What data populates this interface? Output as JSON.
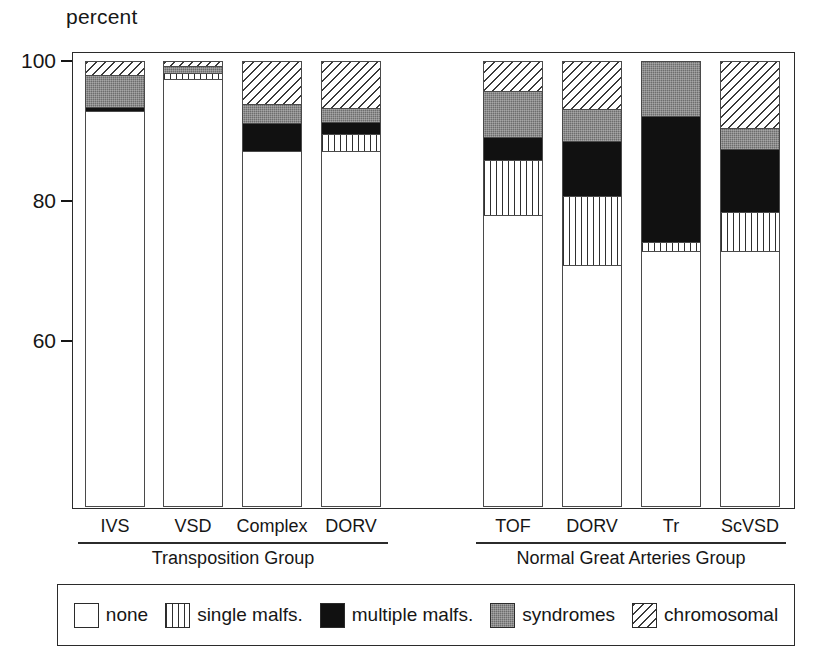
{
  "axis_title": "percent",
  "yticks": [
    {
      "label": "100",
      "value": 100
    },
    {
      "label": "80",
      "value": 80
    },
    {
      "label": "60",
      "value": 60
    }
  ],
  "groups": [
    {
      "name": "Transposition  Group",
      "categories": [
        "IVS",
        "VSD",
        "Complex",
        "DORV"
      ]
    },
    {
      "name": "Normal Great Arteries Group",
      "categories": [
        "TOF",
        "DORV",
        "Tr",
        "ScVSD"
      ]
    }
  ],
  "legend": [
    {
      "key": "none",
      "label": "none"
    },
    {
      "key": "single",
      "label": "single malfs."
    },
    {
      "key": "multiple",
      "label": "multiple malfs."
    },
    {
      "key": "syndromes",
      "label": "syndromes"
    },
    {
      "key": "chromosomal",
      "label": "chromosomal"
    }
  ],
  "colors": {
    "none": "#ffffff",
    "single": "#ffffff",
    "multiple": "#111111",
    "syndromes": "#6d6d6d",
    "chromosomal": "#ffffff",
    "axis": "#2b2b2b",
    "text": "#161616"
  },
  "chart_data": {
    "type": "bar",
    "subtype": "stacked-bar-100",
    "title": "",
    "xlabel": "",
    "ylabel": "percent",
    "ylim": [
      55,
      100
    ],
    "grid": false,
    "legend_position": "bottom",
    "categories": [
      "IVS",
      "VSD",
      "Complex",
      "DORV",
      "TOF",
      "DORV",
      "Tr",
      "ScVSD"
    ],
    "category_groups": [
      "Transposition  Group",
      "Transposition  Group",
      "Transposition  Group",
      "Transposition  Group",
      "Normal Great Arteries Group",
      "Normal Great Arteries Group",
      "Normal Great Arteries Group",
      "Normal Great Arteries Group"
    ],
    "series": [
      {
        "name": "none",
        "values": [
          89.0,
          96.4,
          80.0,
          80.1,
          65.7,
          54.4,
          57.6,
          57.6
        ]
      },
      {
        "name": "single malfs.",
        "values": [
          0.0,
          1.3,
          0.0,
          3.9,
          12.4,
          15.4,
          1.8,
          8.7
        ]
      },
      {
        "name": "multiple malfs.",
        "values": [
          0.9,
          0.0,
          6.4,
          2.6,
          5.0,
          12.4,
          28.3,
          14.1
        ]
      },
      {
        "name": "syndromes",
        "values": [
          7.1,
          1.4,
          4.1,
          3.1,
          10.4,
          7.1,
          12.3,
          4.7
        ]
      },
      {
        "name": "chromosomal",
        "values": [
          3.0,
          0.9,
          9.5,
          10.3,
          6.5,
          10.7,
          0.0,
          14.9
        ]
      }
    ]
  },
  "layout": {
    "bars": [
      {
        "x": 85,
        "w": 60
      },
      {
        "x": 163,
        "w": 60
      },
      {
        "x": 242,
        "w": 60
      },
      {
        "x": 321,
        "w": 60
      },
      {
        "x": 483,
        "w": 60
      },
      {
        "x": 562,
        "w": 60
      },
      {
        "x": 641,
        "w": 60
      },
      {
        "x": 720,
        "w": 60
      }
    ],
    "group_rules": [
      {
        "x": 78,
        "w": 310,
        "label_x": 78,
        "label_w": 310
      },
      {
        "x": 476,
        "w": 310,
        "label_x": 476,
        "label_w": 310
      }
    ]
  }
}
